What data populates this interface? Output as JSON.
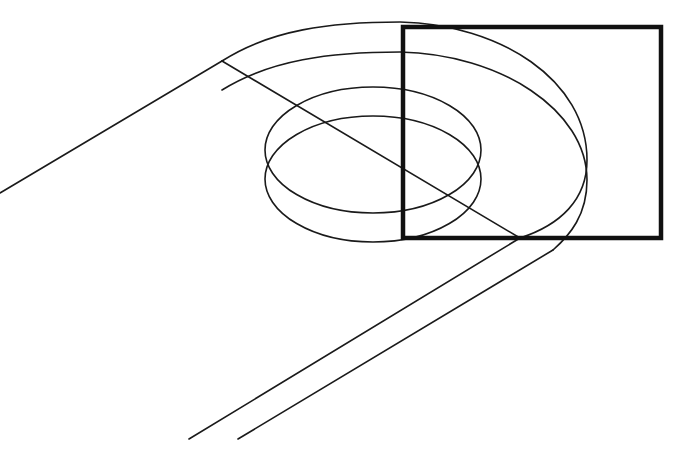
{
  "drawing": {
    "type": "wireframe-line-drawing",
    "description": "Isometric wireframe of a slotted link/arm with a cylindrical hole, with a highlighted selection rectangle",
    "colors": {
      "background": "#ffffff",
      "stroke": "#1a1a1a",
      "selection_box": "#111111"
    },
    "selection_box": {
      "x": 403,
      "y": 27,
      "width": 258,
      "height": 211
    }
  }
}
